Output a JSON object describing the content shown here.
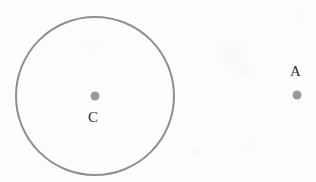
{
  "figure": {
    "kind": "geometry-diagram",
    "background_color": "#fdfdfd",
    "width": 316,
    "height": 182,
    "stroke_color": "#8e8e92",
    "point_color": "#9a9a9a",
    "label_color": "#2e2e2e"
  },
  "circle": {
    "name": "circle-c",
    "center_x": 95,
    "center_y": 96,
    "radius": 79,
    "stroke_width": 2,
    "stroke_color": "#8e8e92",
    "fill": "none",
    "clipped_at_bottom": true
  },
  "points": [
    {
      "id": "C",
      "label": "C",
      "x": 95,
      "y": 96,
      "dot_radius": 4.5,
      "dot_color": "#9a9a9a",
      "label_x": 88,
      "label_y": 110,
      "label_font_size": 15,
      "label_position": "below",
      "role": "center-of-circle"
    },
    {
      "id": "A",
      "label": "A",
      "x": 297,
      "y": 95,
      "dot_radius": 4.5,
      "dot_color": "#9a9a9a",
      "label_x": 290,
      "label_y": 64,
      "label_font_size": 15,
      "label_position": "above",
      "role": "external-point"
    }
  ]
}
